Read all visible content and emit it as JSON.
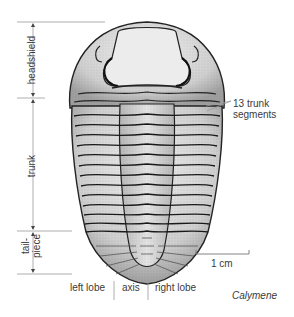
{
  "figure": {
    "genus": "Calymene",
    "regions": [
      {
        "id": "headshield",
        "label": "headshield"
      },
      {
        "id": "trunk",
        "label": "trunk"
      },
      {
        "id": "tailpiece",
        "label": "tail-\npiece",
        "line1": "tail-",
        "line2": "piece"
      }
    ],
    "lobes": {
      "left": "left lobe",
      "axis": "axis",
      "right": "right lobe"
    },
    "segments_note": {
      "line1": "13 trunk",
      "line2": "segments"
    },
    "scale_bar": {
      "label": "1 cm"
    },
    "caption": "Calymene",
    "colors": {
      "ink": "#222222",
      "shell_light": "#e6e6e6",
      "shell_mid": "#bdbdbd",
      "shell_dark": "#8a8a8a",
      "label_line": "#9a9a9a",
      "text": "#3a3a3a"
    }
  }
}
